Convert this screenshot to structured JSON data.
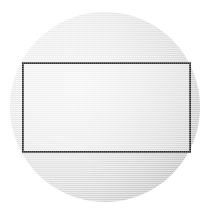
{
  "figure": {
    "background_color": "#ffffff",
    "canvas": {
      "width": 211,
      "height": 216
    },
    "shapes": {
      "circle": {
        "name": "circle",
        "center_x": 105,
        "center_y": 107,
        "radius": 95,
        "fill_style": "gradient-halftone-gray",
        "fill_light_color": "#f2f2f2",
        "fill_mid_color": "#d9d9d9",
        "fill_dark_color": "#b4b4b4",
        "stroke_color": "none",
        "stroke_width": 0
      },
      "rectangle": {
        "name": "rectangle",
        "x": 23,
        "y": 63,
        "width": 167,
        "height": 89,
        "fill_style": "transparent",
        "fill_color": "#ececec",
        "stroke_color": "#2b2b2b",
        "stroke_width": 1.6
      }
    }
  },
  "chart_data": {
    "type": "diagram",
    "xlabel": "",
    "ylabel": "",
    "elements": [
      {
        "shape": "circle",
        "center": [
          105,
          107
        ],
        "radius": 95,
        "fill": "#d9d9d9",
        "stroke": "none"
      },
      {
        "shape": "rectangle",
        "top_left": [
          23,
          63
        ],
        "bottom_right": [
          190,
          152
        ],
        "width": 167,
        "height": 89,
        "fill": "none",
        "stroke": "#2b2b2b"
      }
    ],
    "annotations": []
  }
}
